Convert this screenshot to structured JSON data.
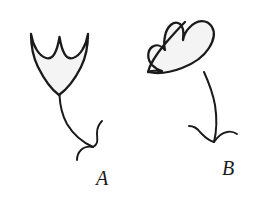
{
  "figure": {
    "background_color": "#ffffff",
    "ink_color": "#1a1a1a",
    "shape_fill_color": "#f4f4f4",
    "items": [
      {
        "id": "A",
        "label": "A",
        "name": "figure-a",
        "orientation": "upright",
        "rotation_degrees": 0,
        "head_shape": "scalloped-bowl",
        "scallop_count": 2,
        "point_count": 3,
        "tail": "curved-with-barbed-tip"
      },
      {
        "id": "B",
        "label": "B",
        "name": "figure-b",
        "orientation": "rotated-counterclockwise",
        "rotation_degrees": 48,
        "head_shape": "scalloped-bowl",
        "scallop_count": 2,
        "point_count": 3,
        "tail": "curved-with-barbed-tip"
      }
    ]
  }
}
